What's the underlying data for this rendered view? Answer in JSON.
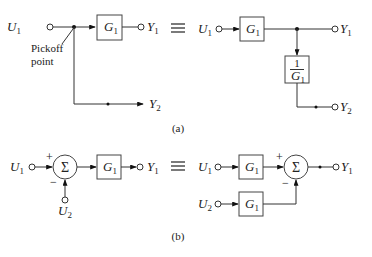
{
  "figure": {
    "part_a": {
      "caption": "(a)",
      "left": {
        "input": {
          "sym": "U",
          "sub": "1"
        },
        "block": {
          "sym": "G",
          "sub": "1"
        },
        "output1": {
          "sym": "Y",
          "sub": "1"
        },
        "output2": {
          "sym": "Y",
          "sub": "2"
        },
        "annotation_line1": "Pickoff",
        "annotation_line2": "point"
      },
      "equivalence": "≡",
      "right": {
        "input": {
          "sym": "U",
          "sub": "1"
        },
        "block": {
          "sym": "G",
          "sub": "1"
        },
        "inverse_block": {
          "num": "1",
          "sym": "G",
          "sub": "1"
        },
        "output1": {
          "sym": "Y",
          "sub": "1"
        },
        "output2": {
          "sym": "Y",
          "sub": "2"
        }
      }
    },
    "part_b": {
      "caption": "(b)",
      "left": {
        "input1": {
          "sym": "U",
          "sub": "1"
        },
        "input2": {
          "sym": "U",
          "sub": "2"
        },
        "sum_symbol": "Σ",
        "plus": "+",
        "minus": "−",
        "block": {
          "sym": "G",
          "sub": "1"
        },
        "output": {
          "sym": "Y",
          "sub": "1"
        }
      },
      "equivalence": "≡",
      "right": {
        "input1": {
          "sym": "U",
          "sub": "1"
        },
        "input2": {
          "sym": "U",
          "sub": "2"
        },
        "block_top": {
          "sym": "G",
          "sub": "1"
        },
        "block_bottom": {
          "sym": "G",
          "sub": "1"
        },
        "sum_symbol": "Σ",
        "plus": "+",
        "minus": "−",
        "output": {
          "sym": "Y",
          "sub": "1"
        }
      }
    }
  }
}
